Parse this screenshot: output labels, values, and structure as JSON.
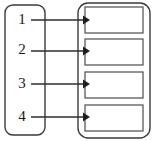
{
  "diagram": {
    "type": "flow-mapping-diagram",
    "colors": {
      "background": "#ffffff",
      "outline": "#3a3a3a",
      "inner_box_outline": "#5a5a5a",
      "arrow": "#1f1f1f",
      "label_text": "#1a1a1a"
    },
    "left_container": {
      "name": "source-container",
      "x": 5,
      "y": 5,
      "width": 40,
      "height": 130,
      "corner_radius": 8,
      "items": [
        {
          "label": "1",
          "cx": 22,
          "cy": 20
        },
        {
          "label": "2",
          "cx": 22,
          "cy": 50
        },
        {
          "label": "3",
          "cx": 22,
          "cy": 84
        },
        {
          "label": "4",
          "cx": 22,
          "cy": 117
        }
      ]
    },
    "right_container": {
      "name": "target-container",
      "x": 78,
      "y": 3,
      "width": 72,
      "height": 135,
      "corner_radius": 10,
      "boxes": [
        {
          "label": "",
          "x": 85,
          "y": 7,
          "width": 58,
          "height": 26
        },
        {
          "label": "",
          "x": 85,
          "y": 39,
          "width": 58,
          "height": 26
        },
        {
          "label": "",
          "x": 85,
          "y": 72,
          "width": 58,
          "height": 26
        },
        {
          "label": "",
          "x": 85,
          "y": 105,
          "width": 58,
          "height": 26
        }
      ]
    },
    "connectors": [
      {
        "from": "1",
        "to": "box-1",
        "x1": 31,
        "x2": 84,
        "y": 20
      },
      {
        "from": "2",
        "to": "box-2",
        "x1": 31,
        "x2": 84,
        "y": 51
      },
      {
        "from": "3",
        "to": "box-3",
        "x1": 31,
        "x2": 84,
        "y": 84
      },
      {
        "from": "4",
        "to": "box-4",
        "x1": 31,
        "x2": 84,
        "y": 117
      }
    ]
  }
}
